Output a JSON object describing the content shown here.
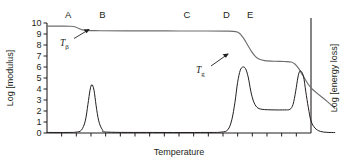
{
  "chart_data": {
    "type": "line",
    "title": "",
    "xlabel": "Temperature",
    "ylabel": "Log [modulus]",
    "y2label": "Log [energy loss]",
    "ylim": [
      0,
      10
    ],
    "yticks": [
      "0",
      "1",
      "2",
      "3",
      "4",
      "5",
      "6",
      "7",
      "8",
      "9",
      "10"
    ],
    "xticks_labeled": false,
    "xtick_count": 17,
    "grid": false,
    "legend": "none",
    "region_labels": [
      {
        "label": "A",
        "x_frac": 0.08
      },
      {
        "label": "B",
        "x_frac": 0.21
      },
      {
        "label": "C",
        "x_frac": 0.53
      },
      {
        "label": "D",
        "x_frac": 0.68
      },
      {
        "label": "E",
        "x_frac": 0.77
      }
    ],
    "annotations": [
      {
        "name": "T-beta",
        "base": "T",
        "sub": "β",
        "points_to": "modulus beta-relaxation drop"
      },
      {
        "name": "T-g",
        "base": "T",
        "sub": "g",
        "points_to": "modulus glass-transition drop"
      }
    ],
    "series": [
      {
        "name": "modulus",
        "axis": "left",
        "points": [
          [
            0.0,
            9.72
          ],
          [
            0.06,
            9.72
          ],
          [
            0.09,
            9.7
          ],
          [
            0.11,
            9.62
          ],
          [
            0.125,
            9.45
          ],
          [
            0.14,
            9.35
          ],
          [
            0.16,
            9.31
          ],
          [
            0.2,
            9.3
          ],
          [
            0.3,
            9.29
          ],
          [
            0.45,
            9.28
          ],
          [
            0.6,
            9.27
          ],
          [
            0.68,
            9.26
          ],
          [
            0.715,
            9.22
          ],
          [
            0.73,
            9.05
          ],
          [
            0.745,
            8.6
          ],
          [
            0.76,
            8.0
          ],
          [
            0.775,
            7.4
          ],
          [
            0.79,
            6.95
          ],
          [
            0.805,
            6.7
          ],
          [
            0.825,
            6.58
          ],
          [
            0.86,
            6.52
          ],
          [
            0.9,
            6.5
          ],
          [
            0.925,
            6.45
          ],
          [
            0.94,
            6.25
          ],
          [
            0.955,
            5.8
          ],
          [
            0.97,
            5.2
          ],
          [
            1.0,
            4.1
          ],
          [
            1.06,
            2.9
          ],
          [
            1.09,
            2.25
          ]
        ]
      },
      {
        "name": "energy-loss",
        "axis": "right",
        "points": [
          [
            0.0,
            0.05
          ],
          [
            0.08,
            0.05
          ],
          [
            0.11,
            0.08
          ],
          [
            0.13,
            0.25
          ],
          [
            0.145,
            1.1
          ],
          [
            0.155,
            2.6
          ],
          [
            0.163,
            3.9
          ],
          [
            0.17,
            4.4
          ],
          [
            0.178,
            3.9
          ],
          [
            0.186,
            2.5
          ],
          [
            0.196,
            1.1
          ],
          [
            0.21,
            0.3
          ],
          [
            0.23,
            0.08
          ],
          [
            0.4,
            0.05
          ],
          [
            0.6,
            0.05
          ],
          [
            0.66,
            0.08
          ],
          [
            0.685,
            0.3
          ],
          [
            0.7,
            1.2
          ],
          [
            0.712,
            2.8
          ],
          [
            0.722,
            4.6
          ],
          [
            0.732,
            5.7
          ],
          [
            0.742,
            6.0
          ],
          [
            0.752,
            5.85
          ],
          [
            0.762,
            5.1
          ],
          [
            0.772,
            3.8
          ],
          [
            0.782,
            2.9
          ],
          [
            0.795,
            2.35
          ],
          [
            0.815,
            2.15
          ],
          [
            0.86,
            2.1
          ],
          [
            0.9,
            2.1
          ],
          [
            0.92,
            2.15
          ],
          [
            0.932,
            2.6
          ],
          [
            0.942,
            3.8
          ],
          [
            0.95,
            5.0
          ],
          [
            0.956,
            5.55
          ],
          [
            0.963,
            5.6
          ],
          [
            0.972,
            5.1
          ],
          [
            0.98,
            3.8
          ],
          [
            0.99,
            2.3
          ],
          [
            1.0,
            1.1
          ],
          [
            1.015,
            0.45
          ],
          [
            1.035,
            0.15
          ],
          [
            1.06,
            0.06
          ],
          [
            1.09,
            0.04
          ]
        ]
      }
    ]
  }
}
